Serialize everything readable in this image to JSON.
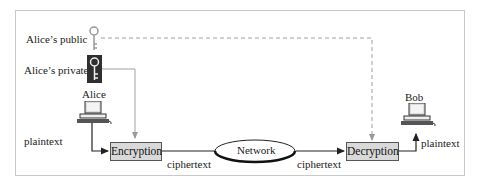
{
  "diagram": {
    "keys": {
      "public_label": "Alice’s public",
      "private_label": "Alice’s private"
    },
    "nodes": {
      "alice": "Alice",
      "bob": "Bob",
      "encryption": "Encryption",
      "decryption": "Decryption",
      "network": "Network"
    },
    "edges": {
      "alice_plaintext": "plaintext",
      "enc_ciphertext": "ciphertext",
      "net_ciphertext": "ciphertext",
      "bob_plaintext": "plaintext"
    },
    "colors": {
      "box_fill": "#d9d9d9",
      "line": "#333333",
      "key_line": "#9a9a9a",
      "private_key_bg": "#2f2f2f"
    }
  }
}
